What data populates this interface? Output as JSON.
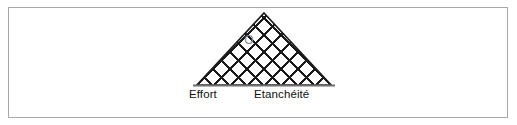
{
  "figure": {
    "title": "",
    "background_color": "#ffffff",
    "frame": {
      "border_color": "#a8a8a8",
      "fill_color": "#ffffff"
    }
  },
  "diagram": {
    "type": "lattice-triangle",
    "shape_name": "triangle",
    "apex": {
      "x": 264,
      "y": 13
    },
    "base_left": {
      "x": 197,
      "y": 85
    },
    "base_right": {
      "x": 331,
      "y": 85
    },
    "outline_color": "#1a1a1a",
    "outline_width": 1.6,
    "fill_color": "#ffffff",
    "grid": {
      "style": "diamond-lattice",
      "line_color": "#1a1a1a",
      "line_width": 1.5,
      "cell_pitch": 17,
      "rows": 4,
      "columns": 8
    },
    "baseline": {
      "color": "#6f6f6f",
      "width": 2.2,
      "y": 85,
      "x_start": 193,
      "x_end": 335
    },
    "marker": {
      "label": "O",
      "x": 249,
      "y": 40,
      "color": "#888888",
      "font_size": 11
    }
  },
  "labels": {
    "left": "Effort",
    "right": "Etanchéité"
  }
}
